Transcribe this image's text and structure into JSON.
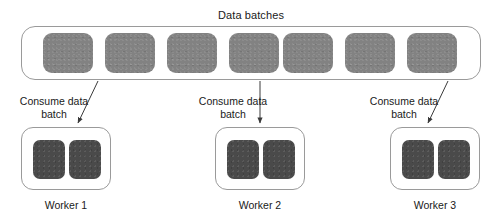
{
  "diagram": {
    "title": "Data batches",
    "type": "data-parallel-worker-diagram",
    "colors": {
      "batch_fill": "#828282",
      "worker_chunk_fill": "#4a4a4a",
      "outline": "#9a9a9a",
      "background": "#ffffff",
      "text": "#1a1a1a"
    }
  },
  "batches": {
    "count": 7,
    "items": [
      {
        "index": 1
      },
      {
        "index": 2
      },
      {
        "index": 3
      },
      {
        "index": 4
      },
      {
        "index": 5
      },
      {
        "index": 6
      },
      {
        "index": 7
      }
    ]
  },
  "workers": [
    {
      "id": "worker-1",
      "label": "Worker 1",
      "consume_line1": "Consume data",
      "consume_line2": "batch",
      "arrow": "diagonal-down-left",
      "chunks": 2
    },
    {
      "id": "worker-2",
      "label": "Worker 2",
      "consume_line1": "Consume data",
      "consume_line2": "batch",
      "arrow": "vertical-down",
      "chunks": 2
    },
    {
      "id": "worker-3",
      "label": "Worker 3",
      "consume_line1": "Consume data",
      "consume_line2": "batch",
      "arrow": "diagonal-down-left",
      "chunks": 2
    }
  ]
}
